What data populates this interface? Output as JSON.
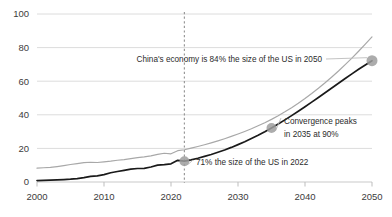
{
  "chart_data": {
    "type": "line",
    "title": "",
    "subtitle": "",
    "xlabel": "",
    "ylabel": "",
    "xlim": [
      2000,
      2050
    ],
    "ylim": [
      0,
      100
    ],
    "grid": true,
    "legend_position": "none",
    "x_ticks": [
      "2000",
      "2010",
      "2020",
      "2030",
      "2040",
      "2050"
    ],
    "x_tick_values": [
      2000,
      2010,
      2020,
      2030,
      2040,
      2050
    ],
    "y_ticks": [
      "0",
      "20",
      "40",
      "60",
      "80",
      "100"
    ],
    "y_tick_values": [
      0,
      20,
      40,
      60,
      80,
      100
    ],
    "series": [
      {
        "name": "United States",
        "color": "#a8a8a8",
        "style": "solid",
        "x": [
          2000,
          2001,
          2002,
          2003,
          2004,
          2005,
          2006,
          2007,
          2008,
          2009,
          2010,
          2011,
          2012,
          2013,
          2014,
          2015,
          2016,
          2017,
          2018,
          2019,
          2020,
          2021,
          2022,
          2023,
          2024,
          2025,
          2026,
          2027,
          2028,
          2029,
          2030,
          2031,
          2032,
          2033,
          2034,
          2035,
          2036,
          2037,
          2038,
          2039,
          2040,
          2041,
          2042,
          2043,
          2044,
          2045,
          2046,
          2047,
          2048,
          2049,
          2050
        ],
        "values": [
          10.3,
          10.6,
          10.9,
          11.5,
          12.2,
          13.0,
          13.7,
          14.4,
          14.7,
          14.5,
          15.0,
          15.5,
          16.2,
          16.7,
          17.4,
          18.2,
          18.7,
          19.5,
          20.5,
          21.4,
          21.0,
          23.3,
          24.0,
          25.2,
          26.4,
          27.7,
          29.1,
          30.6,
          32.2,
          33.9,
          35.7,
          37.6,
          39.6,
          41.8,
          44.1,
          46.6,
          49.3,
          52.2,
          55.3,
          58.6,
          62.1,
          65.8,
          69.7,
          73.8,
          78.1,
          82.6,
          87.3,
          92.2,
          97.3,
          102.6,
          108.0
        ]
      },
      {
        "name": "China",
        "color": "#1a1a1a",
        "style": "solid",
        "x": [
          2000,
          2001,
          2002,
          2003,
          2004,
          2005,
          2006,
          2007,
          2008,
          2009,
          2010,
          2011,
          2012,
          2013,
          2014,
          2015,
          2016,
          2017,
          2018,
          2019,
          2020,
          2021,
          2022,
          2023,
          2024,
          2025,
          2026,
          2027,
          2028,
          2029,
          2030,
          2031,
          2032,
          2033,
          2034,
          2035,
          2036,
          2037,
          2038,
          2039,
          2040,
          2041,
          2042,
          2043,
          2044,
          2045,
          2046,
          2047,
          2048,
          2049,
          2050
        ],
        "values": [
          1.2,
          1.3,
          1.5,
          1.7,
          2.0,
          2.3,
          2.8,
          3.6,
          4.6,
          5.1,
          6.1,
          7.6,
          8.6,
          9.6,
          10.5,
          11.1,
          11.2,
          12.3,
          13.9,
          14.3,
          14.9,
          17.8,
          17.1,
          18.2,
          19.5,
          21.0,
          22.6,
          24.4,
          26.3,
          28.4,
          30.7,
          33.1,
          35.7,
          38.4,
          41.3,
          44.4,
          47.6,
          51.0,
          54.5,
          58.1,
          61.8,
          65.6,
          69.4,
          73.3,
          77.2,
          81.1,
          85.0,
          88.8,
          92.5,
          96.1,
          99.6
        ]
      }
    ],
    "reference_line": {
      "name": "year-2022-marker",
      "x": 2022,
      "style": "dashed",
      "color": "#9a9a9a"
    },
    "markers": [
      {
        "id": "marker-2022",
        "x": 2022,
        "y": 17.1,
        "color": "#9e9e9e",
        "radius": 5
      },
      {
        "id": "marker-2035",
        "x": 2035,
        "y": 44.4,
        "color": "#9e9e9e",
        "radius": 5
      },
      {
        "id": "marker-2050",
        "x": 2050,
        "y": 99.6,
        "color": "#9e9e9e",
        "radius": 5.5
      }
    ],
    "annotations": [
      {
        "id": "annotation-2050",
        "text": "China's economy is 84% the size of the US in 2050",
        "value_pct": 84,
        "year": 2050
      },
      {
        "id": "annotation-2035",
        "text_line1": "Convergence peaks",
        "text_line2": "in 2035 at 90%",
        "value_pct": 90,
        "year": 2035
      },
      {
        "id": "annotation-2022",
        "text": "71% the size of the US in 2022",
        "value_pct": 71,
        "year": 2022
      }
    ]
  },
  "colors": {
    "background": "#ffffff",
    "grid": "#dcdcdc",
    "axis_text": "#3c3c3c",
    "annotation_text": "#2b2b2b",
    "series_us": "#a8a8a8",
    "series_china": "#1a1a1a",
    "marker": "#9e9e9e",
    "dashed_line": "#9a9a9a"
  }
}
